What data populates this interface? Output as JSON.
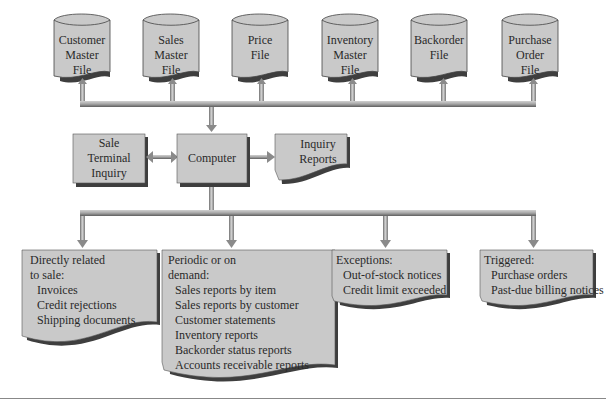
{
  "colors": {
    "box_fill": "#c8c8c8",
    "shadow": "#4a4a4a",
    "connector": "#a8a8a8",
    "connector_dark": "#707070",
    "background": "#ffffff"
  },
  "files": [
    {
      "label": "Customer\nMaster\nFile",
      "lines": [
        "Customer",
        "Master",
        "File"
      ]
    },
    {
      "label": "Sales\nMaster\nFile",
      "lines": [
        "Sales",
        "Master",
        "File"
      ]
    },
    {
      "label": "Price\nFile",
      "lines": [
        "Price",
        "File"
      ]
    },
    {
      "label": "Inventory\nMaster\nFile",
      "lines": [
        "Inventory",
        "Master",
        "File"
      ]
    },
    {
      "label": "Backorder\nFile",
      "lines": [
        "Backorder",
        "File"
      ]
    },
    {
      "label": "Purchase\nOrder\nFile",
      "lines": [
        "Purchase",
        "Order",
        "File"
      ]
    }
  ],
  "middle": {
    "terminal": {
      "lines": [
        "Sale",
        "Terminal",
        "Inquiry"
      ]
    },
    "computer": {
      "label": "Computer"
    },
    "inquiry_reports": {
      "lines": [
        "Inquiry",
        "Reports"
      ]
    }
  },
  "outputs": [
    {
      "heading_lines": [
        "Directly related",
        "to sale:"
      ],
      "items": [
        "Invoices",
        "Credit rejections",
        "Shipping documents"
      ]
    },
    {
      "heading_lines": [
        "Periodic or on",
        "demand:"
      ],
      "items": [
        "Sales reports by item",
        "Sales reports by customer",
        "Customer statements",
        "Inventory reports",
        "Backorder status reports",
        "Accounts receivable reports"
      ]
    },
    {
      "heading_lines": [
        "Exceptions:"
      ],
      "items": [
        "Out-of-stock notices",
        "Credit limit exceeded"
      ]
    },
    {
      "heading_lines": [
        "Triggered:"
      ],
      "items": [
        "Purchase orders",
        "Past-due billing notices"
      ]
    }
  ]
}
